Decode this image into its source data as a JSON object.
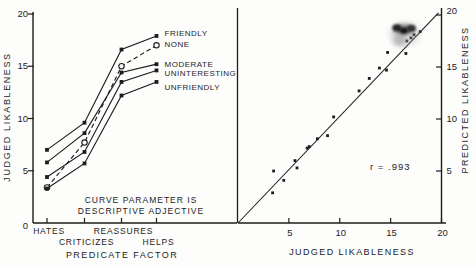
{
  "figure": {
    "background": "#fdfdfc",
    "ink": "#1c1c1c",
    "description_zero_label": "0"
  },
  "chart_data": [
    {
      "type": "line",
      "panel": "left",
      "xlabel": "PREDICATE FACTOR",
      "ylabel": "JUDGED LIKABLENESS",
      "categories": [
        "HATES",
        "CRITICIZES",
        "REASSURES",
        "HELPS"
      ],
      "categories_stagger_rows": [
        0,
        1,
        0,
        1
      ],
      "ylim": [
        0,
        20
      ],
      "yticks": [
        0,
        5,
        10,
        15,
        20
      ],
      "grid": false,
      "legend_position": "right-of-curve-ends",
      "series": [
        {
          "name": "FRIENDLY",
          "values": [
            7.0,
            9.6,
            16.6,
            17.9
          ],
          "line": "solid",
          "marker": "filled-square"
        },
        {
          "name": "NONE",
          "values": [
            3.4,
            7.7,
            15.0,
            17.0
          ],
          "line": "dashed",
          "marker": "open-circle"
        },
        {
          "name": "MODERATE",
          "values": [
            5.8,
            8.6,
            14.4,
            15.2
          ],
          "line": "solid",
          "marker": "filled-square"
        },
        {
          "name": "UNINTERESTING",
          "values": [
            4.4,
            6.8,
            13.5,
            14.6
          ],
          "line": "solid",
          "marker": "filled-square"
        },
        {
          "name": "UNFRIENDLY",
          "values": [
            3.3,
            5.7,
            12.2,
            13.5
          ],
          "line": "solid",
          "marker": "filled-square"
        }
      ],
      "annotation_lines": [
        "CURVE PARAMETER IS",
        "DESCRIPTIVE ADJECTIVE"
      ]
    },
    {
      "type": "scatter",
      "panel": "right",
      "xlabel": "JUDGED LIKABLENESS",
      "ylabel": "PREDICTED LIKABLENESS",
      "xlim": [
        0,
        20
      ],
      "ylim": [
        0,
        20
      ],
      "xticks": [
        5,
        10,
        15,
        20
      ],
      "yticks": [
        5,
        10,
        15,
        20
      ],
      "grid": false,
      "annotation": "r = .993",
      "fit_line": {
        "from": [
          0,
          0
        ],
        "to": [
          19.7,
          20.2
        ]
      },
      "points": [
        [
          3.4,
          2.9
        ],
        [
          3.5,
          5.0
        ],
        [
          4.5,
          4.1
        ],
        [
          5.6,
          6.0
        ],
        [
          5.8,
          5.3
        ],
        [
          6.8,
          7.2
        ],
        [
          7.0,
          7.35
        ],
        [
          7.8,
          8.1
        ],
        [
          8.8,
          8.4
        ],
        [
          9.4,
          10.2
        ],
        [
          11.9,
          12.7
        ],
        [
          12.9,
          13.9
        ],
        [
          13.9,
          14.9
        ],
        [
          14.6,
          14.7
        ],
        [
          14.7,
          16.4
        ],
        [
          16.5,
          16.3
        ],
        [
          17.3,
          18.1
        ],
        [
          16.6,
          17.5
        ],
        [
          17.0,
          17.8
        ],
        [
          17.9,
          18.4
        ]
      ],
      "artifact": {
        "type": "ink-smudge",
        "x": 16.3,
        "y": 18.4
      }
    }
  ]
}
